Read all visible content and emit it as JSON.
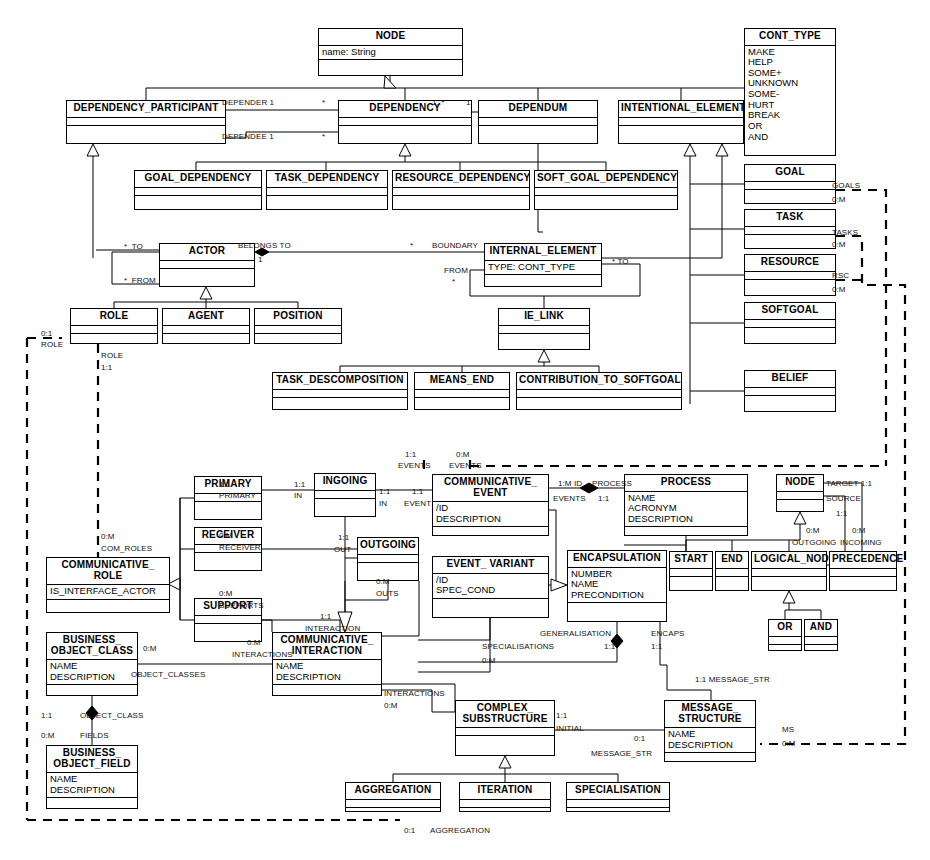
{
  "diagram": {
    "type": "uml-class-diagram"
  },
  "classes": [
    {
      "id": "node_top",
      "name": "NODE",
      "attrs": "name: String",
      "ops": "",
      "x": 318,
      "y": 28,
      "w": 145,
      "h": 48
    },
    {
      "id": "dep_participant",
      "name": "DEPENDENCY_PARTICIPANT",
      "attrs": "",
      "ops": "",
      "x": 66,
      "y": 100,
      "w": 160,
      "h": 44
    },
    {
      "id": "dependency",
      "name": "DEPENDENCY",
      "attrs": "",
      "ops": "",
      "x": 338,
      "y": 100,
      "w": 134,
      "h": 44
    },
    {
      "id": "dependum",
      "name": "DEPENDUM",
      "attrs": "",
      "ops": "",
      "x": 478,
      "y": 100,
      "w": 120,
      "h": 44
    },
    {
      "id": "intentional_el",
      "name": "INTENTIONAL_ELEMENT",
      "attrs": "",
      "ops": "",
      "x": 618,
      "y": 100,
      "w": 126,
      "h": 44
    },
    {
      "id": "cont_type",
      "name": "CONT_TYPE",
      "attrs": "MAKE\nHELP\nSOME+\nUNKNOWN\nSOME-\nHURT\nBREAK\nOR\nAND",
      "ops": null,
      "x": 744,
      "y": 28,
      "w": 92,
      "h": 128
    },
    {
      "id": "goal_dep",
      "name": "GOAL_DEPENDENCY",
      "attrs": "",
      "ops": "",
      "x": 134,
      "y": 170,
      "w": 128,
      "h": 40
    },
    {
      "id": "task_dep",
      "name": "TASK_DEPENDENCY",
      "attrs": "",
      "ops": "",
      "x": 266,
      "y": 170,
      "w": 122,
      "h": 40
    },
    {
      "id": "resource_dep",
      "name": "RESOURCE_DEPENDENCY",
      "attrs": "",
      "ops": "",
      "x": 392,
      "y": 170,
      "w": 138,
      "h": 40
    },
    {
      "id": "softgoal_dep",
      "name": "SOFT_GOAL_DEPENDENCY",
      "attrs": "",
      "ops": "",
      "x": 534,
      "y": 170,
      "w": 144,
      "h": 40
    },
    {
      "id": "goal",
      "name": "GOAL",
      "attrs": "",
      "ops": "",
      "x": 744,
      "y": 164,
      "w": 92,
      "h": 40
    },
    {
      "id": "task",
      "name": "TASK",
      "attrs": "",
      "ops": "",
      "x": 744,
      "y": 209,
      "w": 92,
      "h": 40
    },
    {
      "id": "resource",
      "name": "RESOURCE",
      "attrs": "",
      "ops": "",
      "x": 744,
      "y": 254,
      "w": 92,
      "h": 42
    },
    {
      "id": "softgoal",
      "name": "SOFTGOAL",
      "attrs": "",
      "ops": "",
      "x": 744,
      "y": 302,
      "w": 92,
      "h": 42
    },
    {
      "id": "belief",
      "name": "BELIEF",
      "attrs": "",
      "ops": "",
      "x": 744,
      "y": 370,
      "w": 92,
      "h": 42
    },
    {
      "id": "actor",
      "name": "ACTOR",
      "attrs": "",
      "ops": "",
      "x": 159,
      "y": 243,
      "w": 96,
      "h": 44
    },
    {
      "id": "internal_el",
      "name": "INTERNAL_ELEMENT",
      "attrs": "TYPE: CONT_TYPE",
      "ops": "",
      "x": 484,
      "y": 243,
      "w": 118,
      "h": 44
    },
    {
      "id": "role",
      "name": "ROLE",
      "attrs": "",
      "ops": "",
      "x": 70,
      "y": 308,
      "w": 88,
      "h": 36
    },
    {
      "id": "agent",
      "name": "AGENT",
      "attrs": "",
      "ops": "",
      "x": 162,
      "y": 308,
      "w": 88,
      "h": 36
    },
    {
      "id": "position",
      "name": "POSITION",
      "attrs": "",
      "ops": "",
      "x": 254,
      "y": 308,
      "w": 88,
      "h": 36
    },
    {
      "id": "ie_link",
      "name": "IE_LINK",
      "attrs": "",
      "ops": "",
      "x": 498,
      "y": 308,
      "w": 92,
      "h": 42
    },
    {
      "id": "task_decomp",
      "name": "TASK_DESCOMPOSITION",
      "attrs": "",
      "ops": "",
      "x": 272,
      "y": 372,
      "w": 136,
      "h": 38
    },
    {
      "id": "means_end",
      "name": "MEANS_END",
      "attrs": "",
      "ops": "",
      "x": 414,
      "y": 372,
      "w": 96,
      "h": 38
    },
    {
      "id": "contrib_softgoal",
      "name": "CONTRIBUTION_TO_SOFTGOAL",
      "attrs": "",
      "ops": "",
      "x": 516,
      "y": 372,
      "w": 166,
      "h": 38
    },
    {
      "id": "primary",
      "name": "PRIMARY",
      "attrs": "",
      "ops": "",
      "x": 194,
      "y": 476,
      "w": 68,
      "h": 44
    },
    {
      "id": "receiver",
      "name": "RECEIVER",
      "attrs": "",
      "ops": "",
      "x": 194,
      "y": 527,
      "w": 68,
      "h": 44
    },
    {
      "id": "support",
      "name": "SUPPORT",
      "attrs": "",
      "ops": "",
      "x": 194,
      "y": 598,
      "w": 68,
      "h": 44
    },
    {
      "id": "ingoing",
      "name": "INGOING",
      "attrs": "",
      "ops": "",
      "x": 314,
      "y": 473,
      "w": 62,
      "h": 44
    },
    {
      "id": "outgoing",
      "name": "OUTGOING",
      "attrs": "",
      "ops": "",
      "x": 357,
      "y": 537,
      "w": 62,
      "h": 44
    },
    {
      "id": "comm_event",
      "name": "COMMUNICATIVE_\nEVENT",
      "attrs": "/ID\nDESCRIPTION",
      "ops": "",
      "x": 432,
      "y": 474,
      "w": 117,
      "h": 62
    },
    {
      "id": "event_variant",
      "name": "EVENT_\nVARIANT",
      "attrs": "/ID\nSPEC_COND",
      "ops": "",
      "x": 432,
      "y": 556,
      "w": 117,
      "h": 62
    },
    {
      "id": "process",
      "name": "PROCESS",
      "attrs": "NAME\nACRONYM\nDESCRIPTION",
      "ops": "",
      "x": 624,
      "y": 474,
      "w": 124,
      "h": 62
    },
    {
      "id": "encapsulation",
      "name": "ENCAPSULATION",
      "attrs": "NUMBER\nNAME\nPRECONDITION",
      "ops": "",
      "x": 567,
      "y": 550,
      "w": 100,
      "h": 72
    },
    {
      "id": "node_low",
      "name": "NODE",
      "attrs": "",
      "ops": "",
      "x": 776,
      "y": 474,
      "w": 48,
      "h": 38
    },
    {
      "id": "start",
      "name": "START",
      "attrs": "",
      "ops": "",
      "x": 669,
      "y": 551,
      "w": 44,
      "h": 40
    },
    {
      "id": "end",
      "name": "END",
      "attrs": "",
      "ops": "",
      "x": 715,
      "y": 551,
      "w": 34,
      "h": 40
    },
    {
      "id": "logical_node",
      "name": "LOGICAL_NODE",
      "attrs": "",
      "ops": "",
      "x": 751,
      "y": 551,
      "w": 76,
      "h": 40
    },
    {
      "id": "precedence",
      "name": "PRECEDENCE",
      "attrs": "",
      "ops": "",
      "x": 829,
      "y": 551,
      "w": 68,
      "h": 40
    },
    {
      "id": "or_node",
      "name": "OR",
      "attrs": "",
      "ops": "",
      "x": 768,
      "y": 619,
      "w": 34,
      "h": 32
    },
    {
      "id": "and_node",
      "name": "AND",
      "attrs": "",
      "ops": "",
      "x": 804,
      "y": 619,
      "w": 34,
      "h": 32
    },
    {
      "id": "comm_role",
      "name": "COMMUNICATIVE_\nROLE",
      "attrs": "IS_INTERFACE_ACTOR",
      "ops": "",
      "x": 46,
      "y": 557,
      "w": 124,
      "h": 56
    },
    {
      "id": "bus_obj_class",
      "name": "BUSINESS_\nOBJECT_CLASS",
      "attrs": "NAME\nDESCRIPTION",
      "ops": "",
      "x": 46,
      "y": 632,
      "w": 92,
      "h": 64
    },
    {
      "id": "bus_obj_field",
      "name": "BUSINESS_\nOBJECT_FIELD",
      "attrs": "NAME\nDESCRIPTION",
      "ops": "",
      "x": 46,
      "y": 745,
      "w": 92,
      "h": 64
    },
    {
      "id": "comm_interact",
      "name": "COMMUNICATIVE_\nINTERACTION",
      "attrs": "NAME\nDESCRIPTION",
      "ops": "",
      "x": 272,
      "y": 632,
      "w": 110,
      "h": 64
    },
    {
      "id": "complex_sub",
      "name": "COMPLEX_\nSUBSTRUCTURE",
      "attrs": "",
      "ops": "",
      "x": 455,
      "y": 700,
      "w": 100,
      "h": 56
    },
    {
      "id": "msg_structure",
      "name": "MESSAGE_\nSTRUCTURE",
      "attrs": "NAME\nDESCRIPTION",
      "ops": "",
      "x": 664,
      "y": 700,
      "w": 92,
      "h": 62
    },
    {
      "id": "aggregation",
      "name": "AGGREGATION",
      "attrs": "",
      "ops": "",
      "x": 345,
      "y": 782,
      "w": 96,
      "h": 30
    },
    {
      "id": "iteration",
      "name": "ITERATION",
      "attrs": "",
      "ops": "",
      "x": 459,
      "y": 782,
      "w": 92,
      "h": 30
    },
    {
      "id": "specialisation",
      "name": "SPECIALISATION",
      "attrs": "",
      "ops": "",
      "x": 566,
      "y": 782,
      "w": 104,
      "h": 30
    }
  ],
  "labels": [
    {
      "text": "DEPENDER 1",
      "x": 222,
      "y": 99
    },
    {
      "text": "*",
      "x": 322,
      "y": 99
    },
    {
      "text": "DEPENDEE 1",
      "x": 222,
      "y": 133
    },
    {
      "text": "*",
      "x": 322,
      "y": 133
    },
    {
      "text": "1..*",
      "x": 432,
      "y": 99
    },
    {
      "text": "1",
      "x": 466,
      "y": 99
    },
    {
      "text": "GOALS",
      "x": 832,
      "y": 182
    },
    {
      "text": "0:M",
      "x": 832,
      "y": 196
    },
    {
      "text": "TASKS",
      "x": 832,
      "y": 229
    },
    {
      "text": "0:M",
      "x": 832,
      "y": 241
    },
    {
      "text": "RSC",
      "x": 832,
      "y": 272
    },
    {
      "text": "0:M",
      "x": 832,
      "y": 286
    },
    {
      "text": "*  TO",
      "x": 124,
      "y": 243
    },
    {
      "text": "*  FROM",
      "x": 124,
      "y": 277
    },
    {
      "text": "BELONGS TO",
      "x": 238,
      "y": 242
    },
    {
      "text": "1",
      "x": 258,
      "y": 256
    },
    {
      "text": "*",
      "x": 410,
      "y": 242
    },
    {
      "text": "BOUNDARY",
      "x": 432,
      "y": 242
    },
    {
      "text": "FROM",
      "x": 444,
      "y": 267
    },
    {
      "text": "*",
      "x": 452,
      "y": 278
    },
    {
      "text": "* TO",
      "x": 612,
      "y": 258
    },
    {
      "text": "0:1",
      "x": 41,
      "y": 330
    },
    {
      "text": "ROLE",
      "x": 41,
      "y": 341
    },
    {
      "text": "ROLE",
      "x": 101,
      "y": 352
    },
    {
      "text": "1:1",
      "x": 101,
      "y": 364
    },
    {
      "text": "0:M",
      "x": 101,
      "y": 533
    },
    {
      "text": "COM_ROLES",
      "x": 101,
      "y": 545
    },
    {
      "text": "1:1",
      "x": 405,
      "y": 451
    },
    {
      "text": "EVENTS",
      "x": 398,
      "y": 462
    },
    {
      "text": "0:M",
      "x": 456,
      "y": 451
    },
    {
      "text": "EVENTS",
      "x": 449,
      "y": 462
    },
    {
      "text": "1:1",
      "x": 219,
      "y": 481
    },
    {
      "text": "PRIMARY",
      "x": 219,
      "y": 492
    },
    {
      "text": "1:1",
      "x": 294,
      "y": 481
    },
    {
      "text": "IN",
      "x": 294,
      "y": 492
    },
    {
      "text": "1:1",
      "x": 379,
      "y": 488
    },
    {
      "text": "IN",
      "x": 379,
      "y": 500
    },
    {
      "text": "1:1",
      "x": 412,
      "y": 488
    },
    {
      "text": "EVENT",
      "x": 404,
      "y": 500
    },
    {
      "text": "0:M",
      "x": 219,
      "y": 532
    },
    {
      "text": "RECEIVER",
      "x": 219,
      "y": 544
    },
    {
      "text": "1:1",
      "x": 338,
      "y": 534
    },
    {
      "text": "OUT",
      "x": 334,
      "y": 546
    },
    {
      "text": "0:M",
      "x": 219,
      "y": 590
    },
    {
      "text": "SUPPORTS",
      "x": 219,
      "y": 602
    },
    {
      "text": "1:1",
      "x": 320,
      "y": 613
    },
    {
      "text": "INTERACTION",
      "x": 305,
      "y": 625
    },
    {
      "text": "0:M",
      "x": 376,
      "y": 578
    },
    {
      "text": "OUTS",
      "x": 376,
      "y": 590
    },
    {
      "text": "0:M",
      "x": 247,
      "y": 639
    },
    {
      "text": "INTERACTIONS",
      "x": 232,
      "y": 651
    },
    {
      "text": "1:M ID",
      "x": 558,
      "y": 480
    },
    {
      "text": "EVENTS",
      "x": 553,
      "y": 495
    },
    {
      "text": "PROCESS",
      "x": 592,
      "y": 480
    },
    {
      "text": "1:1",
      "x": 598,
      "y": 495
    },
    {
      "text": "TARGET 1:1",
      "x": 826,
      "y": 480
    },
    {
      "text": "SOURCE",
      "x": 826,
      "y": 495
    },
    {
      "text": "1:1",
      "x": 836,
      "y": 510
    },
    {
      "text": "0:M",
      "x": 806,
      "y": 527
    },
    {
      "text": "OUTGOING",
      "x": 792,
      "y": 539
    },
    {
      "text": "0:M",
      "x": 852,
      "y": 527
    },
    {
      "text": "INCOMING",
      "x": 840,
      "y": 539
    },
    {
      "text": "GENERALISATION",
      "x": 540,
      "y": 630
    },
    {
      "text": "1:1",
      "x": 604,
      "y": 643
    },
    {
      "text": "ENCAPS",
      "x": 651,
      "y": 630
    },
    {
      "text": "1:1",
      "x": 651,
      "y": 643
    },
    {
      "text": "SPECIALISATIONS",
      "x": 482,
      "y": 643
    },
    {
      "text": "0:M",
      "x": 482,
      "y": 657
    },
    {
      "text": "0:M",
      "x": 143,
      "y": 645
    },
    {
      "text": "OBJECT_CLASSES",
      "x": 131,
      "y": 671
    },
    {
      "text": "1:1",
      "x": 41,
      "y": 712
    },
    {
      "text": "OBJECT_CLASS",
      "x": 80,
      "y": 712
    },
    {
      "text": "0:M",
      "x": 41,
      "y": 732
    },
    {
      "text": "FIELDS",
      "x": 80,
      "y": 732
    },
    {
      "text": "INTERACTIONS",
      "x": 384,
      "y": 690
    },
    {
      "text": "0:M",
      "x": 384,
      "y": 702
    },
    {
      "text": "1:1",
      "x": 556,
      "y": 712
    },
    {
      "text": "INITIAL",
      "x": 556,
      "y": 725
    },
    {
      "text": "0:1",
      "x": 634,
      "y": 735
    },
    {
      "text": "MESSAGE_STR",
      "x": 591,
      "y": 750
    },
    {
      "text": "1:1 MESSAGE_STR",
      "x": 695,
      "y": 676
    },
    {
      "text": "MS",
      "x": 782,
      "y": 726
    },
    {
      "text": "0:M",
      "x": 782,
      "y": 740
    },
    {
      "text": "0:1",
      "x": 404,
      "y": 827
    },
    {
      "text": "AGGREGATION",
      "x": 430,
      "y": 827
    }
  ]
}
